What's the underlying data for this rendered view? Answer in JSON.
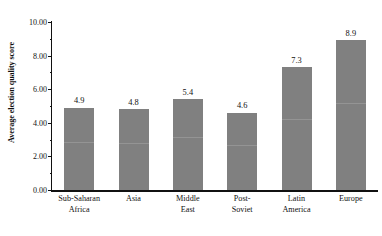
{
  "chart_data": {
    "type": "bar",
    "title": "",
    "xlabel": "",
    "ylabel": "Average election quality score",
    "categories": [
      "Sub-Saharan Africa",
      "Asia",
      "Middle East",
      "Post-Soviet",
      "Latin America",
      "Europe"
    ],
    "category_lines": [
      [
        "Sub-Saharan",
        "Africa"
      ],
      [
        "Asia"
      ],
      [
        "Middle",
        "East"
      ],
      [
        "Post-",
        "Soviet"
      ],
      [
        "Latin",
        "America"
      ],
      [
        "Europe"
      ]
    ],
    "values": [
      4.9,
      4.8,
      5.4,
      4.6,
      7.3,
      8.9
    ],
    "value_labels": [
      "4.9",
      "4.8",
      "5.4",
      "4.6",
      "7.3",
      "8.9"
    ],
    "ylim": [
      0,
      10
    ],
    "ytick_values": [
      0,
      2,
      4,
      6,
      8,
      10
    ],
    "ytick_labels": [
      "0.00",
      "2.00",
      "4.00",
      "6.00",
      "8.00",
      "10.00"
    ],
    "minor_tick_values": [
      1,
      3,
      5,
      7,
      9
    ],
    "grid": false,
    "legend": null,
    "bar_color": "#808080",
    "axis_color": "#111111",
    "background_color": "#ffffff"
  }
}
